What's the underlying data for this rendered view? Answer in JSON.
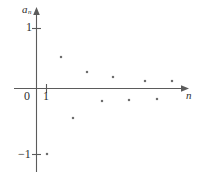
{
  "figure": {
    "kind": "scatter-plot",
    "background": "#ffffff",
    "point_color": "#6e6e6e",
    "axis_color": "#5b5b5b"
  },
  "axes": {
    "y_axis_label": "a",
    "y_axis_label_sub": "n",
    "x_axis_label": "n",
    "origin_label": "0",
    "y_tick_top_label": "1",
    "y_tick_bottom_label": "−1",
    "x_tick_label": "1"
  },
  "chart_data": {
    "type": "scatter",
    "title": "",
    "xlabel": "n",
    "ylabel": "a_n",
    "grid": false,
    "legend": null,
    "xlim": [
      0,
      16
    ],
    "ylim": [
      -1.2,
      1.2
    ],
    "yticks": [
      -1,
      1
    ],
    "ytick_labels": [
      "−1",
      "1"
    ],
    "xticks": [
      1
    ],
    "xtick_labels": [
      "1"
    ],
    "x": [
      1,
      2,
      3,
      4,
      5,
      6,
      7,
      8,
      9,
      10,
      11
    ],
    "y": [
      -1,
      0.53,
      -0.5,
      0.26,
      -0.2,
      0.18,
      -0.14,
      0.13,
      -0.11,
      0.1,
      0.08
    ],
    "points": [
      {
        "n": 1,
        "value": -1.0,
        "px": 47,
        "py": 154
      },
      {
        "n": 2,
        "value": 0.53,
        "px": 61,
        "py": 57
      },
      {
        "n": 3,
        "value": -0.5,
        "px": 73,
        "py": 118
      },
      {
        "n": 4,
        "value": 0.26,
        "px": 87,
        "py": 72
      },
      {
        "n": 5,
        "value": -0.2,
        "px": 102,
        "py": 101
      },
      {
        "n": 6,
        "value": 0.18,
        "px": 113,
        "py": 77
      },
      {
        "n": 7,
        "value": -0.14,
        "px": 129,
        "py": 100
      },
      {
        "n": 8,
        "value": 0.13,
        "px": 145,
        "py": 81
      },
      {
        "n": 9,
        "value": -0.11,
        "px": 157,
        "py": 99
      },
      {
        "n": 10,
        "value": 0.1,
        "px": 172,
        "py": 81
      }
    ]
  }
}
